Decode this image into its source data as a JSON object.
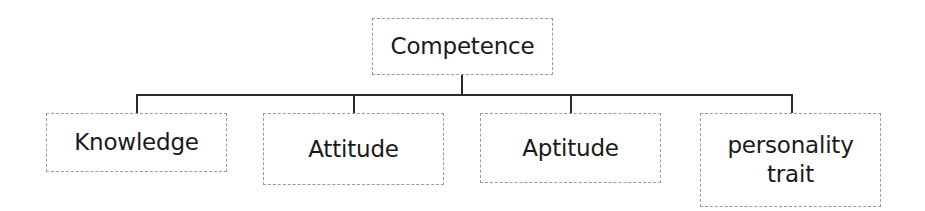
{
  "diagram": {
    "type": "hierarchy",
    "root": {
      "label": "Competence"
    },
    "children": [
      {
        "label": "Knowledge"
      },
      {
        "label": "Attitude"
      },
      {
        "label": "Aptitude"
      },
      {
        "label": "personality\ntrait"
      }
    ],
    "colors": {
      "box_border": "#9a9a9a",
      "connector": "#2a2a2a",
      "text": "#1a1a1a",
      "background": "#ffffff"
    }
  }
}
